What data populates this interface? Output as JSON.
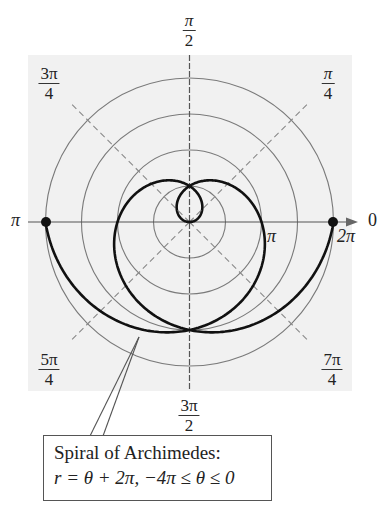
{
  "chart_data": {
    "type": "line",
    "subtype": "polar",
    "title": "Spiral of Archimedes",
    "equation": "r = θ + 2π, −4π ≤ θ ≤ 0",
    "function": {
      "r_expr": "theta + 2*pi",
      "theta_min": -12.566370614,
      "theta_max": 0
    },
    "key_points": [
      {
        "theta": "-4π",
        "r": "-2π",
        "label": "π"
      },
      {
        "theta": "-3π",
        "r": "-π"
      },
      {
        "theta": "-2π",
        "r": "0"
      },
      {
        "theta": "-π",
        "r": "π",
        "label": "π"
      },
      {
        "theta": "0",
        "r": "2π",
        "label": "2π"
      }
    ],
    "marked_points": [
      {
        "theta_deg": 180,
        "r_units": 6.283185
      },
      {
        "theta_deg": 0,
        "r_units": 6.283185
      }
    ],
    "polar_grid": {
      "circle_radii": [
        "π/2",
        "π",
        "3π/2",
        "2π"
      ],
      "angle_lines_deg": [
        0,
        45,
        90,
        135,
        180,
        225,
        270,
        315
      ],
      "diagonal_style": "dashed"
    },
    "angle_labels": [
      "0",
      "π/4",
      "π/2",
      "3π/4",
      "π",
      "5π/4",
      "3π/2",
      "7π/4"
    ],
    "axis_tick_labels": [
      "π",
      "2π"
    ],
    "grid": true,
    "legend": null
  },
  "render": {
    "cx": 189.5,
    "cy": 222,
    "scale": 22.92,
    "bg": {
      "x": 28,
      "y": 55,
      "w": 324,
      "h": 336,
      "color": "#f1f1f1"
    },
    "colors": {
      "curve": "#111111",
      "grid": "#7a7a7a",
      "axis": "#555555"
    }
  },
  "labels": {
    "pi_half": {
      "num": "π",
      "den": "2"
    },
    "three_pi_quarter": {
      "num": "3π",
      "den": "4"
    },
    "pi_quarter": {
      "num": "π",
      "den": "4"
    },
    "five_pi_quarter": {
      "num": "5π",
      "den": "4"
    },
    "seven_pi_quarter": {
      "num": "7π",
      "den": "4"
    },
    "three_pi_half": {
      "num": "3π",
      "den": "2"
    },
    "pi_left": "π",
    "zero_right": "0",
    "tick_pi": "π",
    "tick_two_pi": "2π"
  },
  "callout": {
    "line1": "Spiral of Archimedes:",
    "line2": "r = θ + 2π, −4π ≤ θ ≤ 0"
  }
}
